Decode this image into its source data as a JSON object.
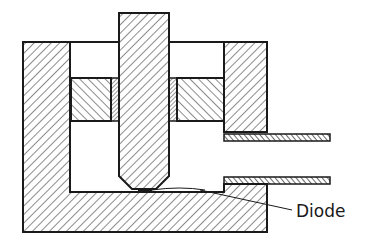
{
  "diagram": {
    "type": "cross-section",
    "labels": {
      "diode": "Diode"
    },
    "colors": {
      "ink": "#1a1a1a",
      "background": "#ffffff"
    },
    "parts": [
      {
        "id": "outer-housing",
        "hatch": "forward-diagonal"
      },
      {
        "id": "plunger",
        "hatch": "forward-diagonal"
      },
      {
        "id": "insert-block-left",
        "hatch": "back-diagonal"
      },
      {
        "id": "insert-block-right",
        "hatch": "back-diagonal"
      },
      {
        "id": "insulating-sleeve-left",
        "hatch": "fine-forward-diagonal"
      },
      {
        "id": "insulating-sleeve-right",
        "hatch": "fine-forward-diagonal"
      },
      {
        "id": "coax-tube-upper",
        "hatch": "fine-back-diagonal"
      },
      {
        "id": "coax-tube-lower",
        "hatch": "fine-back-diagonal"
      },
      {
        "id": "diode-chip"
      }
    ]
  }
}
